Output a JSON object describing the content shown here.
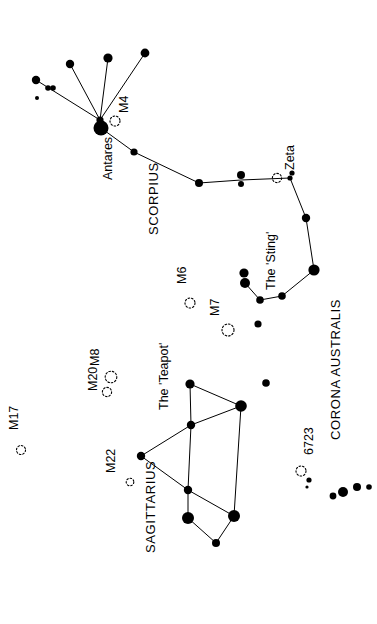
{
  "chart_data": {
    "type": "scatter",
    "title": "",
    "subtitle": "",
    "xlabel": "",
    "ylabel": "",
    "grid": false,
    "legend": "none",
    "orientation": "labels rotated 90 degrees counter-clockwise (read bottom-to-top)",
    "background": "#ffffff",
    "ink": "#000000",
    "xlim": [
      0,
      377
    ],
    "ylim": [
      0,
      624
    ],
    "constellations": [
      {
        "name": "SCORPIUS",
        "label": "SCORPIUS",
        "label_pos": [
          158,
          235
        ],
        "label_rotation": -90
      },
      {
        "name": "SAGITTARIUS",
        "label": "SAGITTARIUS",
        "label_pos": [
          155,
          553
        ],
        "label_rotation": -90
      },
      {
        "name": "CORONA AUSTRALIS",
        "label": "CORONA AUSTRALIS",
        "label_pos": [
          340,
          440
        ],
        "label_rotation": -90
      }
    ],
    "asterisms": [
      {
        "name": "The 'Teapot'",
        "label": "The 'Teapot'",
        "label_pos": [
          168,
          410
        ],
        "label_rotation": -90
      },
      {
        "name": "The 'Sting'",
        "label": "The 'Sting'",
        "label_pos": [
          275,
          290
        ],
        "label_rotation": -90
      }
    ],
    "named_stars": [
      {
        "name": "Antares",
        "label": "Antares",
        "label_pos": [
          112,
          180
        ],
        "label_rotation": -90,
        "x": 101,
        "y": 128,
        "r": 7.5
      },
      {
        "name": "Zeta",
        "label": "Zeta",
        "label_pos": [
          294,
          170
        ],
        "label_rotation": -90,
        "x": 290,
        "y": 178,
        "r": 2.6
      }
    ],
    "deep_sky_objects": [
      {
        "name": "M4",
        "label": "M4",
        "type": "globular cluster",
        "x": 115,
        "y": 121,
        "r": 5.0,
        "label_pos": [
          128,
          113
        ],
        "label_rotation": -90
      },
      {
        "name": "M6",
        "label": "M6",
        "type": "open cluster",
        "x": 190,
        "y": 303,
        "r": 5.0,
        "label_pos": [
          186,
          284
        ],
        "label_rotation": -90
      },
      {
        "name": "M7",
        "label": "M7",
        "type": "open cluster",
        "x": 228,
        "y": 330,
        "r": 6.0,
        "label_pos": [
          219,
          316
        ],
        "label_rotation": -90
      },
      {
        "name": "M17",
        "label": "M17",
        "type": "nebula",
        "x": 21,
        "y": 450,
        "r": 4.5,
        "label_pos": [
          18,
          430
        ],
        "label_rotation": -90
      },
      {
        "name": "M20",
        "label": "M20",
        "type": "nebula",
        "x": 107,
        "y": 392,
        "r": 4.6,
        "label_pos": [
          97,
          391
        ],
        "label_rotation": -90
      },
      {
        "name": "M8",
        "label": "M8",
        "type": "nebula",
        "x": 111,
        "y": 377,
        "r": 5.8,
        "label_pos": [
          99,
          366
        ],
        "label_rotation": -90
      },
      {
        "name": "M22",
        "label": "M22",
        "type": "globular cluster",
        "x": 130,
        "y": 482,
        "r": 3.8,
        "label_pos": [
          115,
          473
        ],
        "label_rotation": -90
      },
      {
        "name": "6723",
        "label": "6723",
        "type": "globular cluster",
        "x": 301,
        "y": 471,
        "r": 5.0,
        "label_pos": [
          313,
          455
        ],
        "label_rotation": -90
      },
      {
        "name": "Zeta-cluster",
        "label": "",
        "type": "open cluster",
        "x": 277,
        "y": 178,
        "r": 4.6,
        "label_pos": [
          0,
          0
        ],
        "label_rotation": -90
      }
    ],
    "stars": [
      {
        "id": "s1",
        "x": 36,
        "y": 80,
        "r": 4.2
      },
      {
        "id": "s2",
        "x": 48,
        "y": 88,
        "r": 2.8
      },
      {
        "id": "s3",
        "x": 53,
        "y": 88,
        "r": 2.8
      },
      {
        "id": "s4",
        "x": 37,
        "y": 98,
        "r": 2.0
      },
      {
        "id": "s5",
        "x": 70,
        "y": 64,
        "r": 4.2
      },
      {
        "id": "s6",
        "x": 108,
        "y": 58,
        "r": 4.6
      },
      {
        "id": "s7",
        "x": 145,
        "y": 53,
        "r": 4.4
      },
      {
        "id": "s8",
        "x": 100,
        "y": 120,
        "r": 3.6
      },
      {
        "id": "s9",
        "x": 101,
        "y": 128,
        "r": 7.5
      },
      {
        "id": "s10",
        "x": 134,
        "y": 152,
        "r": 3.6
      },
      {
        "id": "s11",
        "x": 199,
        "y": 183,
        "r": 4.0
      },
      {
        "id": "s12",
        "x": 241,
        "y": 175,
        "r": 4.0
      },
      {
        "id": "s13",
        "x": 241,
        "y": 184,
        "r": 3.0
      },
      {
        "id": "s14",
        "x": 290,
        "y": 178,
        "r": 2.6
      },
      {
        "id": "s15",
        "x": 292,
        "y": 173,
        "r": 2.6
      },
      {
        "id": "s16",
        "x": 306,
        "y": 218,
        "r": 4.2
      },
      {
        "id": "s17",
        "x": 314,
        "y": 270,
        "r": 5.6
      },
      {
        "id": "s18",
        "x": 282,
        "y": 296,
        "r": 3.8
      },
      {
        "id": "s19",
        "x": 260,
        "y": 300,
        "r": 3.8
      },
      {
        "id": "s20",
        "x": 244,
        "y": 273,
        "r": 4.6
      },
      {
        "id": "s21",
        "x": 245,
        "y": 283,
        "r": 5.0
      },
      {
        "id": "s22",
        "x": 258,
        "y": 324,
        "r": 3.6
      },
      {
        "id": "s23",
        "x": 190,
        "y": 384,
        "r": 4.6
      },
      {
        "id": "s24",
        "x": 191,
        "y": 425,
        "r": 4.2
      },
      {
        "id": "s25",
        "x": 241,
        "y": 406,
        "r": 5.8
      },
      {
        "id": "s26",
        "x": 266,
        "y": 383,
        "r": 3.8
      },
      {
        "id": "s27",
        "x": 141,
        "y": 456,
        "r": 4.2
      },
      {
        "id": "s28",
        "x": 188,
        "y": 490,
        "r": 4.2
      },
      {
        "id": "s29",
        "x": 188,
        "y": 518,
        "r": 6.0
      },
      {
        "id": "s30",
        "x": 234,
        "y": 516,
        "r": 6.0
      },
      {
        "id": "s31",
        "x": 216,
        "y": 543,
        "r": 4.0
      },
      {
        "id": "s32",
        "x": 333,
        "y": 496,
        "r": 3.4
      },
      {
        "id": "s33",
        "x": 343,
        "y": 492,
        "r": 5.0
      },
      {
        "id": "s34",
        "x": 357,
        "y": 487,
        "r": 4.0
      },
      {
        "id": "s35",
        "x": 369,
        "y": 487,
        "r": 2.8
      },
      {
        "id": "s36",
        "x": 309,
        "y": 480,
        "r": 2.6
      },
      {
        "id": "s37",
        "x": 307,
        "y": 487,
        "r": 1.6
      }
    ],
    "constellation_lines": [
      {
        "from": [
          36,
          80
        ],
        "to": [
          100,
          120
        ]
      },
      {
        "from": [
          70,
          64
        ],
        "to": [
          100,
          120
        ]
      },
      {
        "from": [
          108,
          58
        ],
        "to": [
          100,
          120
        ]
      },
      {
        "from": [
          145,
          53
        ],
        "to": [
          100,
          120
        ]
      },
      {
        "from": [
          100,
          120
        ],
        "to": [
          101,
          128
        ]
      },
      {
        "from": [
          101,
          128
        ],
        "to": [
          134,
          152
        ]
      },
      {
        "from": [
          134,
          152
        ],
        "to": [
          199,
          183
        ]
      },
      {
        "from": [
          199,
          183
        ],
        "to": [
          241,
          180
        ]
      },
      {
        "from": [
          241,
          180
        ],
        "to": [
          290,
          178
        ]
      },
      {
        "from": [
          290,
          178
        ],
        "to": [
          306,
          218
        ]
      },
      {
        "from": [
          306,
          218
        ],
        "to": [
          314,
          270
        ]
      },
      {
        "from": [
          314,
          270
        ],
        "to": [
          282,
          296
        ]
      },
      {
        "from": [
          282,
          296
        ],
        "to": [
          260,
          300
        ]
      },
      {
        "from": [
          260,
          300
        ],
        "to": [
          245,
          283
        ]
      },
      {
        "from": [
          190,
          384
        ],
        "to": [
          241,
          406
        ]
      },
      {
        "from": [
          190,
          384
        ],
        "to": [
          191,
          425
        ]
      },
      {
        "from": [
          191,
          425
        ],
        "to": [
          241,
          406
        ]
      },
      {
        "from": [
          191,
          425
        ],
        "to": [
          141,
          456
        ]
      },
      {
        "from": [
          141,
          456
        ],
        "to": [
          188,
          490
        ]
      },
      {
        "from": [
          191,
          425
        ],
        "to": [
          188,
          490
        ]
      },
      {
        "from": [
          241,
          406
        ],
        "to": [
          234,
          516
        ]
      },
      {
        "from": [
          188,
          490
        ],
        "to": [
          234,
          516
        ]
      },
      {
        "from": [
          188,
          490
        ],
        "to": [
          188,
          518
        ]
      },
      {
        "from": [
          188,
          518
        ],
        "to": [
          216,
          543
        ]
      },
      {
        "from": [
          216,
          543
        ],
        "to": [
          234,
          516
        ]
      }
    ]
  }
}
